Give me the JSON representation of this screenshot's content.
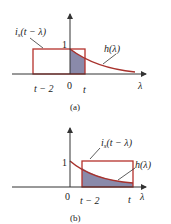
{
  "colors": {
    "axis": "#333333",
    "curve": "#a8322d",
    "rect": "#b5312c",
    "shade": "#8a8aaa"
  },
  "panel_a": {
    "caption": "(a)",
    "input_label_main": "i",
    "input_label_sub": "s",
    "input_label_arg": "(t − λ)",
    "response_label": "h(λ)",
    "tick_one": "1",
    "tick_t_minus_2": "t − 2",
    "tick_zero": "0",
    "tick_t": "t",
    "axis_label": "λ"
  },
  "panel_b": {
    "caption": "(b)",
    "input_label_main": "i",
    "input_label_sub": "s",
    "input_label_arg": "(t − λ)",
    "response_label": "h(λ)",
    "tick_one": "1",
    "tick_zero": "0",
    "tick_t_minus_2": "t − 2",
    "tick_t": "t",
    "axis_label": "λ"
  }
}
